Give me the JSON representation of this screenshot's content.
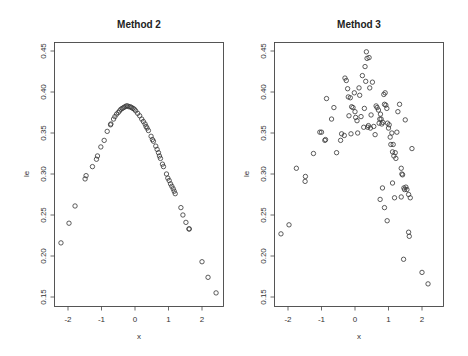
{
  "chart_data": [
    {
      "type": "scatter",
      "title": "Method  2",
      "xlabel": "x",
      "ylabel": "le",
      "xlim": [
        -2.4,
        2.6
      ],
      "ylim": [
        0.137,
        0.46
      ],
      "xticks": [
        -2,
        -1,
        0,
        1,
        2
      ],
      "yticks": [
        0.15,
        0.2,
        0.25,
        0.3,
        0.35,
        0.4,
        0.45
      ],
      "grid": false,
      "marker": "open-circle",
      "points": [
        [
          -2.21,
          0.216
        ],
        [
          -1.97,
          0.24
        ],
        [
          -1.79,
          0.261
        ],
        [
          -1.49,
          0.294
        ],
        [
          -1.46,
          0.298
        ],
        [
          -1.27,
          0.309
        ],
        [
          -1.15,
          0.318
        ],
        [
          -1.12,
          0.322
        ],
        [
          -1.02,
          0.333
        ],
        [
          -0.92,
          0.341
        ],
        [
          -0.83,
          0.352
        ],
        [
          -0.73,
          0.36
        ],
        [
          -0.72,
          0.361
        ],
        [
          -0.64,
          0.367
        ],
        [
          -0.6,
          0.37
        ],
        [
          -0.55,
          0.373
        ],
        [
          -0.5,
          0.375
        ],
        [
          -0.46,
          0.377
        ],
        [
          -0.42,
          0.379
        ],
        [
          -0.38,
          0.38
        ],
        [
          -0.34,
          0.381
        ],
        [
          -0.3,
          0.382
        ],
        [
          -0.26,
          0.383
        ],
        [
          -0.22,
          0.383
        ],
        [
          -0.18,
          0.382
        ],
        [
          -0.14,
          0.382
        ],
        [
          -0.1,
          0.381
        ],
        [
          -0.06,
          0.38
        ],
        [
          -0.02,
          0.379
        ],
        [
          0.02,
          0.377
        ],
        [
          0.08,
          0.374
        ],
        [
          0.14,
          0.371
        ],
        [
          0.2,
          0.367
        ],
        [
          0.25,
          0.364
        ],
        [
          0.3,
          0.361
        ],
        [
          0.33,
          0.358
        ],
        [
          0.36,
          0.356
        ],
        [
          0.4,
          0.353
        ],
        [
          0.48,
          0.346
        ],
        [
          0.52,
          0.342
        ],
        [
          0.55,
          0.34
        ],
        [
          0.62,
          0.334
        ],
        [
          0.66,
          0.33
        ],
        [
          0.7,
          0.326
        ],
        [
          0.73,
          0.322
        ],
        [
          0.76,
          0.319
        ],
        [
          0.82,
          0.312
        ],
        [
          0.85,
          0.309
        ],
        [
          0.94,
          0.3
        ],
        [
          0.98,
          0.295
        ],
        [
          1.02,
          0.292
        ],
        [
          1.06,
          0.288
        ],
        [
          1.1,
          0.285
        ],
        [
          1.14,
          0.282
        ],
        [
          1.17,
          0.279
        ],
        [
          1.2,
          0.276
        ],
        [
          1.37,
          0.259
        ],
        [
          1.43,
          0.25
        ],
        [
          1.52,
          0.241
        ],
        [
          1.61,
          0.233
        ],
        [
          1.62,
          0.233
        ],
        [
          2.0,
          0.193
        ],
        [
          2.18,
          0.174
        ],
        [
          2.42,
          0.155
        ]
      ]
    },
    {
      "type": "scatter",
      "title": "Method  3",
      "xlabel": "x",
      "ylabel": "le",
      "xlim": [
        -2.4,
        2.6
      ],
      "ylim": [
        0.137,
        0.46
      ],
      "xticks": [
        -2,
        -1,
        0,
        1,
        2
      ],
      "yticks": [
        0.15,
        0.2,
        0.25,
        0.3,
        0.35,
        0.4,
        0.45
      ],
      "grid": false,
      "marker": "open-circle",
      "points": [
        [
          -2.21,
          0.227
        ],
        [
          -1.97,
          0.238
        ],
        [
          -1.75,
          0.307
        ],
        [
          -1.49,
          0.291
        ],
        [
          -1.48,
          0.297
        ],
        [
          -1.24,
          0.325
        ],
        [
          -1.05,
          0.351
        ],
        [
          -1.0,
          0.351
        ],
        [
          -0.9,
          0.341
        ],
        [
          -0.88,
          0.342
        ],
        [
          -0.85,
          0.392
        ],
        [
          -0.7,
          0.367
        ],
        [
          -0.63,
          0.381
        ],
        [
          -0.55,
          0.326
        ],
        [
          -0.43,
          0.341
        ],
        [
          -0.4,
          0.349
        ],
        [
          -0.32,
          0.347
        ],
        [
          -0.3,
          0.417
        ],
        [
          -0.26,
          0.414
        ],
        [
          -0.22,
          0.404
        ],
        [
          -0.2,
          0.394
        ],
        [
          -0.18,
          0.371
        ],
        [
          -0.14,
          0.393
        ],
        [
          -0.12,
          0.349
        ],
        [
          -0.1,
          0.382
        ],
        [
          -0.06,
          0.381
        ],
        [
          -0.02,
          0.399
        ],
        [
          0.0,
          0.376
        ],
        [
          0.02,
          0.369
        ],
        [
          0.06,
          0.365
        ],
        [
          0.08,
          0.35
        ],
        [
          0.12,
          0.405
        ],
        [
          0.14,
          0.396
        ],
        [
          0.18,
          0.37
        ],
        [
          0.22,
          0.42
        ],
        [
          0.26,
          0.357
        ],
        [
          0.28,
          0.38
        ],
        [
          0.3,
          0.431
        ],
        [
          0.32,
          0.413
        ],
        [
          0.34,
          0.449
        ],
        [
          0.36,
          0.441
        ],
        [
          0.38,
          0.357
        ],
        [
          0.4,
          0.359
        ],
        [
          0.42,
          0.442
        ],
        [
          0.44,
          0.405
        ],
        [
          0.46,
          0.356
        ],
        [
          0.48,
          0.372
        ],
        [
          0.52,
          0.412
        ],
        [
          0.56,
          0.358
        ],
        [
          0.6,
          0.348
        ],
        [
          0.63,
          0.383
        ],
        [
          0.66,
          0.381
        ],
        [
          0.7,
          0.378
        ],
        [
          0.72,
          0.362
        ],
        [
          0.74,
          0.367
        ],
        [
          0.76,
          0.373
        ],
        [
          0.78,
          0.367
        ],
        [
          0.8,
          0.361
        ],
        [
          0.83,
          0.363
        ],
        [
          0.86,
          0.397
        ],
        [
          0.88,
          0.385
        ],
        [
          0.9,
          0.399
        ],
        [
          0.92,
          0.384
        ],
        [
          0.95,
          0.38
        ],
        [
          0.97,
          0.362
        ],
        [
          1.0,
          0.356
        ],
        [
          1.02,
          0.36
        ],
        [
          1.05,
          0.345
        ],
        [
          1.07,
          0.336
        ],
        [
          1.1,
          0.35
        ],
        [
          1.12,
          0.327
        ],
        [
          1.14,
          0.336
        ],
        [
          1.16,
          0.322
        ],
        [
          1.2,
          0.326
        ],
        [
          1.22,
          0.319
        ],
        [
          1.25,
          0.351
        ],
        [
          1.28,
          0.376
        ],
        [
          1.33,
          0.385
        ],
        [
          1.38,
          0.307
        ],
        [
          1.4,
          0.3
        ],
        [
          1.42,
          0.299
        ],
        [
          1.46,
          0.283
        ],
        [
          1.5,
          0.366
        ],
        [
          1.55,
          0.281
        ],
        [
          1.6,
          0.275
        ],
        [
          1.65,
          0.271
        ],
        [
          1.7,
          0.331
        ],
        [
          0.75,
          0.269
        ],
        [
          0.88,
          0.259
        ],
        [
          0.96,
          0.243
        ],
        [
          0.82,
          0.283
        ],
        [
          1.12,
          0.289
        ],
        [
          1.18,
          0.271
        ],
        [
          1.38,
          0.272
        ],
        [
          1.48,
          0.281
        ],
        [
          1.52,
          0.284
        ],
        [
          1.6,
          0.229
        ],
        [
          1.62,
          0.224
        ],
        [
          1.45,
          0.196
        ],
        [
          2.0,
          0.18
        ],
        [
          2.18,
          0.166
        ]
      ]
    }
  ],
  "panels": [
    {
      "title": "Method  2",
      "xlabel": "x",
      "ylabel": "le"
    },
    {
      "title": "Method  3",
      "xlabel": "x",
      "ylabel": "le"
    }
  ],
  "tick_labels": {
    "x": [
      "-2",
      "-1",
      "0",
      "1",
      "2"
    ],
    "y": [
      "0.15",
      "0.20",
      "0.25",
      "0.30",
      "0.35",
      "0.40",
      "0.45"
    ]
  }
}
